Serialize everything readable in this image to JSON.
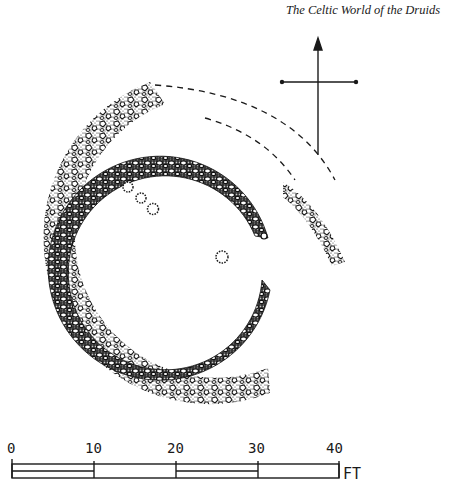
{
  "header": {
    "title": "The Celtic World of the Druids"
  },
  "plan": {
    "description": "Site plan of stone roundhouse rings with post holes",
    "north_arrow": "north-arrow",
    "features": [
      {
        "name": "inner-stone-ring",
        "type": "dense rubble wall arc"
      },
      {
        "name": "outer-stone-ring",
        "type": "loose stone bank arc"
      },
      {
        "name": "outer-ring-fragment",
        "type": "loose stone bank arc"
      },
      {
        "name": "conjectured-outline",
        "type": "dashed lines"
      },
      {
        "name": "post-holes",
        "count": 4
      }
    ]
  },
  "scale_bar": {
    "ticks": [
      "0",
      "10",
      "20",
      "30",
      "40"
    ],
    "unit": "FT"
  },
  "colors": {
    "ink": "#1a1a1a",
    "paper": "#ffffff"
  }
}
